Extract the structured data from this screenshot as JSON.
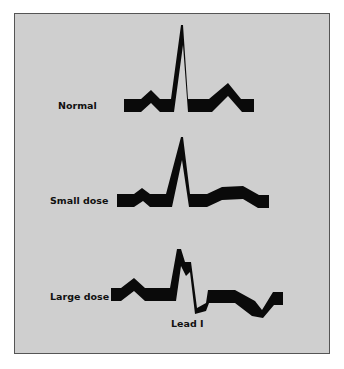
{
  "figure": {
    "traces": [
      {
        "label": "Normal"
      },
      {
        "label": "Small dose"
      },
      {
        "label": "Large dose"
      }
    ],
    "caption": "Lead I"
  },
  "colors": {
    "background": "#cfcfcf",
    "trace": "#0a0a0a",
    "border": "#555555"
  }
}
